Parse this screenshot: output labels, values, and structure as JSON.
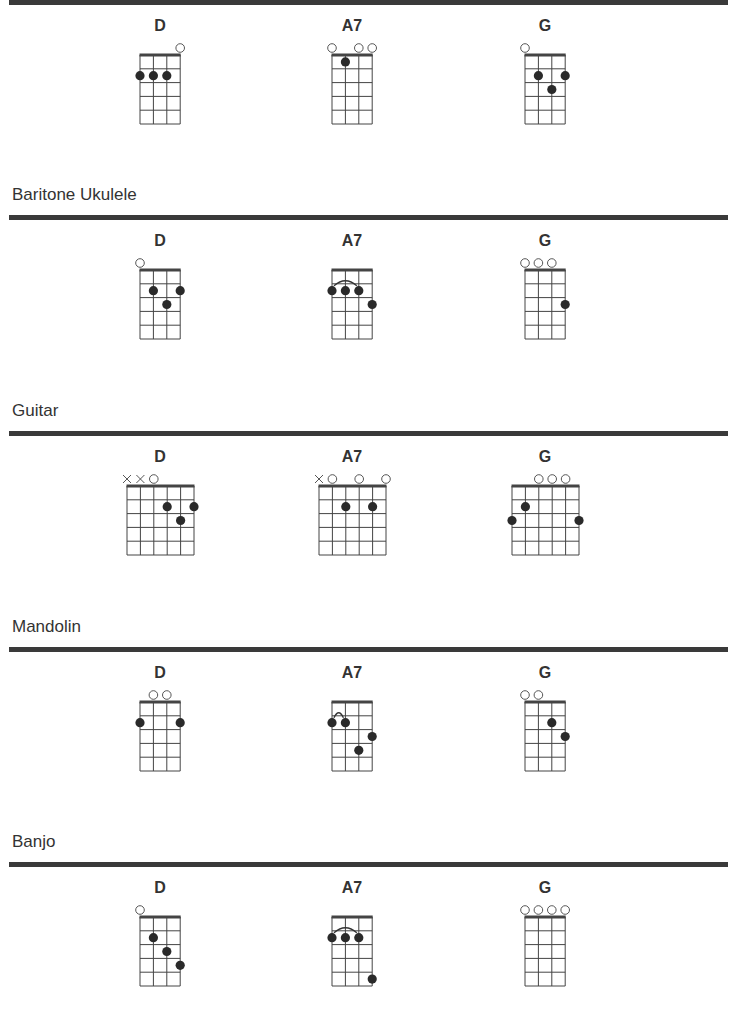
{
  "sections": [
    {
      "title": "",
      "rule_y": 0,
      "strings": 4,
      "chords": [
        {
          "name": "D",
          "markers": [
            "",
            "",
            "",
            "o"
          ],
          "dots": [
            [
              0,
              2
            ],
            [
              1,
              2
            ],
            [
              2,
              2
            ]
          ],
          "barre": null
        },
        {
          "name": "A7",
          "markers": [
            "o",
            "",
            "o",
            "o"
          ],
          "dots": [
            [
              1,
              1
            ]
          ],
          "barre": null
        },
        {
          "name": "G",
          "markers": [
            "o",
            "",
            "",
            ""
          ],
          "dots": [
            [
              1,
              2
            ],
            [
              2,
              3
            ],
            [
              3,
              2
            ]
          ],
          "barre": null
        }
      ]
    },
    {
      "title": "Baritone Ukulele",
      "rule_y": 215,
      "strings": 4,
      "chords": [
        {
          "name": "D",
          "markers": [
            "o",
            "",
            "",
            ""
          ],
          "dots": [
            [
              1,
              2
            ],
            [
              2,
              3
            ],
            [
              3,
              2
            ]
          ],
          "barre": null
        },
        {
          "name": "A7",
          "markers": [
            "",
            "",
            "",
            ""
          ],
          "dots": [
            [
              0,
              2
            ],
            [
              1,
              2
            ],
            [
              2,
              2
            ],
            [
              3,
              3
            ]
          ],
          "barre": [
            0,
            2,
            2
          ]
        },
        {
          "name": "G",
          "markers": [
            "o",
            "o",
            "o",
            ""
          ],
          "dots": [
            [
              3,
              3
            ]
          ],
          "barre": null
        }
      ]
    },
    {
      "title": "Guitar",
      "rule_y": 431,
      "strings": 6,
      "chords": [
        {
          "name": "D",
          "markers": [
            "x",
            "x",
            "o",
            "",
            "",
            ""
          ],
          "dots": [
            [
              3,
              2
            ],
            [
              4,
              3
            ],
            [
              5,
              2
            ]
          ],
          "barre": null
        },
        {
          "name": "A7",
          "markers": [
            "x",
            "o",
            "",
            "o",
            "",
            "o"
          ],
          "dots": [
            [
              2,
              2
            ],
            [
              4,
              2
            ]
          ],
          "barre": null
        },
        {
          "name": "G",
          "markers": [
            "",
            "",
            "o",
            "o",
            "o",
            ""
          ],
          "dots": [
            [
              0,
              3
            ],
            [
              1,
              2
            ],
            [
              5,
              3
            ]
          ],
          "barre": null
        }
      ]
    },
    {
      "title": "Mandolin",
      "rule_y": 647,
      "strings": 4,
      "chords": [
        {
          "name": "D",
          "markers": [
            "",
            "o",
            "o",
            ""
          ],
          "dots": [
            [
              0,
              2
            ],
            [
              3,
              2
            ]
          ],
          "barre": null
        },
        {
          "name": "A7",
          "markers": [
            "",
            "",
            "",
            ""
          ],
          "dots": [
            [
              0,
              2
            ],
            [
              1,
              2
            ],
            [
              2,
              4
            ],
            [
              3,
              3
            ]
          ],
          "barre": [
            0,
            1,
            2
          ]
        },
        {
          "name": "G",
          "markers": [
            "o",
            "o",
            "",
            ""
          ],
          "dots": [
            [
              2,
              2
            ],
            [
              3,
              3
            ]
          ],
          "barre": null
        }
      ]
    },
    {
      "title": "Banjo",
      "rule_y": 862,
      "strings": 4,
      "chords": [
        {
          "name": "D",
          "markers": [
            "o",
            "",
            "",
            ""
          ],
          "dots": [
            [
              1,
              2
            ],
            [
              2,
              3
            ],
            [
              3,
              4
            ]
          ],
          "barre": null
        },
        {
          "name": "A7",
          "markers": [
            "",
            "",
            "",
            ""
          ],
          "dots": [
            [
              0,
              2
            ],
            [
              1,
              2
            ],
            [
              2,
              2
            ],
            [
              3,
              5
            ]
          ],
          "barre": [
            0,
            2,
            2
          ]
        },
        {
          "name": "G",
          "markers": [
            "o",
            "o",
            "o",
            "o"
          ],
          "dots": [],
          "barre": null
        }
      ]
    }
  ],
  "layout": {
    "chord_centers_x": [
      160,
      352,
      545
    ],
    "frets": 5,
    "string_spacing": 13.4,
    "fret_spacing": 13.8
  }
}
